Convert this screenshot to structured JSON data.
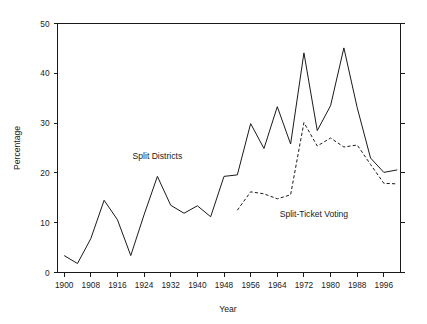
{
  "chart_data": {
    "type": "line",
    "title": "",
    "xlabel": "Year",
    "ylabel": "Percentage",
    "xlim": [
      1898,
      2001
    ],
    "ylim": [
      0,
      50
    ],
    "grid": false,
    "legend_position": "inline-annotations",
    "xticks": [
      1900,
      1908,
      1916,
      1924,
      1932,
      1940,
      1948,
      1956,
      1964,
      1972,
      1980,
      1988,
      1996
    ],
    "xtick_labels": [
      "1900",
      "1908",
      "1916",
      "1924",
      "1932",
      "1940",
      "1948",
      "1956",
      "1964",
      "1972",
      "1980",
      "1988",
      "1996"
    ],
    "yticks": [
      0,
      10,
      20,
      30,
      40,
      50
    ],
    "ytick_labels": [
      "0",
      "10",
      "20",
      "30",
      "40",
      "50"
    ],
    "series": [
      {
        "name": "Split Districts",
        "style": "solid",
        "color": "#1a1a1a",
        "x": [
          1900,
          1904,
          1908,
          1912,
          1916,
          1920,
          1924,
          1928,
          1932,
          1936,
          1940,
          1944,
          1948,
          1952,
          1956,
          1960,
          1964,
          1968,
          1972,
          1976,
          1980,
          1984,
          1988,
          1992,
          1996,
          2000
        ],
        "values": [
          3.4,
          1.8,
          6.8,
          14.5,
          10.6,
          3.4,
          11.6,
          19.3,
          13.5,
          11.9,
          13.4,
          11.2,
          19.3,
          19.6,
          29.9,
          24.9,
          33.3,
          25.8,
          44.1,
          28.5,
          33.5,
          45.1,
          33.1,
          23.0,
          20.1,
          20.6
        ],
        "annotation": {
          "text": "Split Districts",
          "x": 1928,
          "y": 22.8
        }
      },
      {
        "name": "Split-Ticket Voting",
        "style": "dashed",
        "color": "#1a1a1a",
        "x": [
          1952,
          1956,
          1960,
          1964,
          1968,
          1972,
          1976,
          1980,
          1984,
          1988,
          1992,
          1996,
          2000
        ],
        "values": [
          12.5,
          16.2,
          15.8,
          14.8,
          15.6,
          30.1,
          25.4,
          27.0,
          25.2,
          25.6,
          21.7,
          17.9,
          17.8
        ],
        "annotation": {
          "text": "Split-Ticket Voting",
          "x": 1975,
          "y": 11.2
        }
      }
    ]
  },
  "figure": {
    "background_color": "#ffffff",
    "line_color": "#1a1a1a"
  }
}
